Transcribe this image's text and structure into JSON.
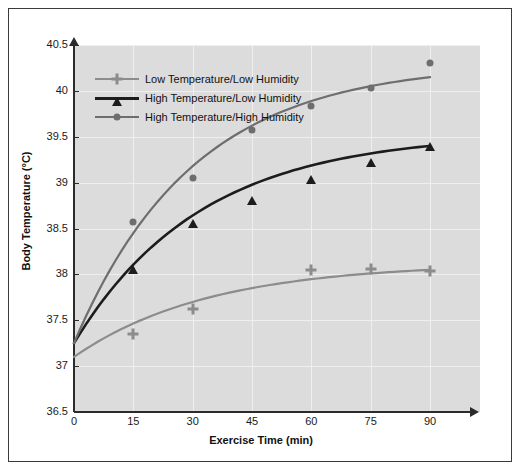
{
  "chart_data": {
    "type": "scatter",
    "title": "",
    "xlabel": "Exercise Time (min)",
    "ylabel": "Body Temperature (°C)",
    "x": [
      0,
      15,
      30,
      45,
      60,
      75,
      90
    ],
    "xticklabels": [
      "0",
      "15",
      "30",
      "45",
      "60",
      "75",
      "90"
    ],
    "yticklabels": [
      "36.5",
      "37",
      "37.5",
      "38",
      "38.5",
      "39",
      "39.5",
      "40",
      "40.5"
    ],
    "yticks": [
      36.5,
      37,
      37.5,
      38,
      38.5,
      39,
      39.5,
      40,
      40.5
    ],
    "xlim": [
      0,
      90
    ],
    "ylim": [
      36.5,
      40.5
    ],
    "grid": true,
    "legend_position": "upper-left-inside",
    "plot_background": "#dcdcdc",
    "series": [
      {
        "name": "Low Temperature/Low Humidity",
        "color": "#8c8c8c",
        "marker": "cross",
        "x": [
          15,
          30,
          60,
          75,
          90
        ],
        "values": [
          37.35,
          37.62,
          38.05,
          38.06,
          38.04
        ],
        "fit_start": 37.1,
        "fit_end": 38.05
      },
      {
        "name": "High Temperature/Low Humidity",
        "color": "#1c1c1c",
        "marker": "triangle",
        "x": [
          15,
          30,
          45,
          60,
          75,
          90
        ],
        "values": [
          38.08,
          38.58,
          38.83,
          39.06,
          39.25,
          39.42
        ],
        "fit_start": 37.25,
        "fit_end": 39.4
      },
      {
        "name": "High Temperature/High Humidity",
        "color": "#6e6e6e",
        "marker": "circle",
        "x": [
          15,
          30,
          45,
          60,
          75,
          90
        ],
        "values": [
          38.57,
          39.05,
          39.57,
          39.83,
          40.03,
          40.3
        ],
        "fit_start": 37.25,
        "fit_end": 40.15
      }
    ]
  },
  "watermark": {
    "text": ""
  }
}
